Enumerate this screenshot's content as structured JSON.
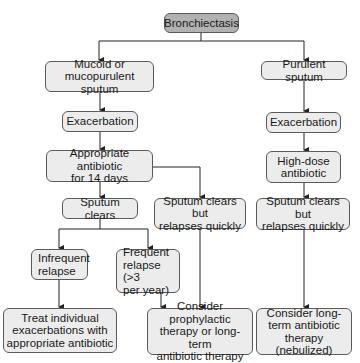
{
  "diagram": {
    "title": "Bronchiectasis",
    "nodes": {
      "root": "Bronchiectasis",
      "mucoid_1": "Mucoid or",
      "mucoid_2": "mucopurulent sputum",
      "purulent": "Purulent sputum",
      "exac_left": "Exacerbation",
      "exac_right": "Exacerbation",
      "approp_1": "Appropriate antibiotic",
      "approp_2": "for 14 days",
      "highdose_1": "High-dose",
      "highdose_2": "antibiotic",
      "clears": "Sputum clears",
      "relapse_mid_1": "Sputum clears but",
      "relapse_mid_2": "relapses quickly",
      "relapse_right_1": "Sputum clears but",
      "relapse_right_2": "relapses quickly",
      "infrequent_1": "Infrequent",
      "infrequent_2": "relapse",
      "frequent_1": "Frequent",
      "frequent_2": "relapse (>3",
      "frequent_3": "per year)",
      "treat_1": "Treat individual",
      "treat_2": "exacerbations with",
      "treat_3": "appropriate antibiotic",
      "prophy_1": "Consider prophylactic",
      "prophy_2": "therapy or long-term",
      "prophy_3": "antibiotic therapy",
      "longterm_1": "Consider long-",
      "longterm_2": "term antibiotic",
      "longterm_3": "therapy (nebulized)"
    },
    "colors": {
      "root_fill": "#b2b2b2",
      "node_fill": "#ececec",
      "border": "#5a5a5a",
      "line": "#222222"
    }
  }
}
